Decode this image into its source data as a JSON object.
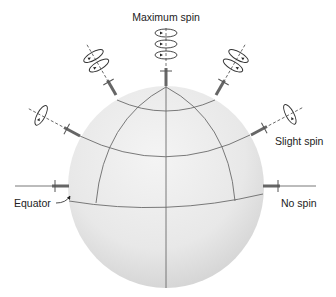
{
  "figure": {
    "labels": {
      "max_spin": "Maximum spin",
      "slight_spin": "Slight spin",
      "equator": "Equator",
      "no_spin": "No spin"
    },
    "colors": {
      "sphere_light": "#f2f2f2",
      "sphere_shade": "#d9d9d9",
      "grid_line": "#6b6b6b",
      "label_text": "#222222"
    }
  }
}
